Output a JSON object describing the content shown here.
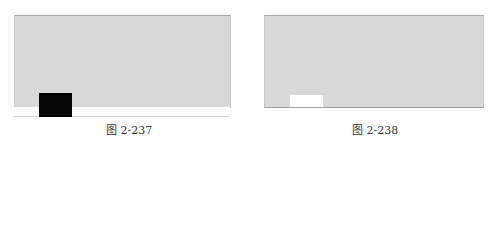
{
  "figures": [
    {
      "id": "left",
      "caption": "图 2-237",
      "marker_color": "#050505",
      "background_color": "#d9d9d9"
    },
    {
      "id": "right",
      "caption": "图 2-238",
      "marker_color": "#ffffff",
      "background_color": "#d9d9d9"
    }
  ]
}
